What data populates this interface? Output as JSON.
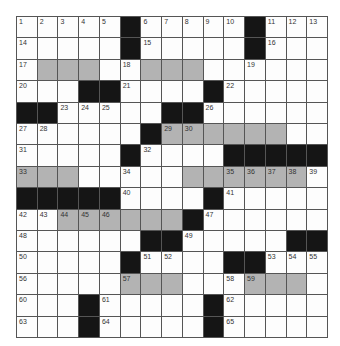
{
  "puzzle": {
    "rows": 15,
    "cols": 15,
    "colors": {
      "black": "#151515",
      "shaded": "#b3b3b3",
      "white": "#fdfdfd",
      "line": "#555555"
    },
    "layout": [
      "WWWWWBWWWWWBWWW",
      "WWWWWBWWWWWBWWW",
      "WSSSWWSSSWWWWWW",
      "WWWBBWWWWBWWWWW",
      "BBWWWWWBBWWWWWW",
      "WWWWWWBSSSSSSWW",
      "WWWWWBWWWWBBBBB",
      "SSSWWWWWSSSSSSW",
      "BBBBBWWWWBWWWWW",
      "WWSSSSSSBWWWWWW",
      "WWWWWWBBWWWWWBB",
      "WWWWWBWWWWBBWWW",
      "WWWWWSSSWWWSSSW",
      "WWWBWWWWWBWWWWW",
      "WWWBWWWWWBWWWWW"
    ],
    "numbers": [
      {
        "r": 0,
        "c": 0,
        "n": "1"
      },
      {
        "r": 0,
        "c": 1,
        "n": "2"
      },
      {
        "r": 0,
        "c": 2,
        "n": "3"
      },
      {
        "r": 0,
        "c": 3,
        "n": "4"
      },
      {
        "r": 0,
        "c": 4,
        "n": "5"
      },
      {
        "r": 0,
        "c": 6,
        "n": "6"
      },
      {
        "r": 0,
        "c": 7,
        "n": "7"
      },
      {
        "r": 0,
        "c": 8,
        "n": "8"
      },
      {
        "r": 0,
        "c": 9,
        "n": "9"
      },
      {
        "r": 0,
        "c": 10,
        "n": "10"
      },
      {
        "r": 0,
        "c": 12,
        "n": "11"
      },
      {
        "r": 0,
        "c": 13,
        "n": "12"
      },
      {
        "r": 0,
        "c": 14,
        "n": "13"
      },
      {
        "r": 1,
        "c": 0,
        "n": "14"
      },
      {
        "r": 1,
        "c": 6,
        "n": "15"
      },
      {
        "r": 1,
        "c": 12,
        "n": "16"
      },
      {
        "r": 2,
        "c": 0,
        "n": "17"
      },
      {
        "r": 2,
        "c": 5,
        "n": "18"
      },
      {
        "r": 2,
        "c": 11,
        "n": "19"
      },
      {
        "r": 3,
        "c": 0,
        "n": "20"
      },
      {
        "r": 3,
        "c": 5,
        "n": "21"
      },
      {
        "r": 3,
        "c": 10,
        "n": "22"
      },
      {
        "r": 4,
        "c": 2,
        "n": "23"
      },
      {
        "r": 4,
        "c": 3,
        "n": "24"
      },
      {
        "r": 4,
        "c": 4,
        "n": "25"
      },
      {
        "r": 4,
        "c": 9,
        "n": "26"
      },
      {
        "r": 5,
        "c": 0,
        "n": "27"
      },
      {
        "r": 5,
        "c": 1,
        "n": "28"
      },
      {
        "r": 5,
        "c": 7,
        "n": "29"
      },
      {
        "r": 5,
        "c": 8,
        "n": "30"
      },
      {
        "r": 6,
        "c": 0,
        "n": "31"
      },
      {
        "r": 6,
        "c": 6,
        "n": "32"
      },
      {
        "r": 7,
        "c": 0,
        "n": "33"
      },
      {
        "r": 7,
        "c": 5,
        "n": "34"
      },
      {
        "r": 7,
        "c": 10,
        "n": "35"
      },
      {
        "r": 7,
        "c": 11,
        "n": "36"
      },
      {
        "r": 7,
        "c": 12,
        "n": "37"
      },
      {
        "r": 7,
        "c": 13,
        "n": "38"
      },
      {
        "r": 7,
        "c": 14,
        "n": "39"
      },
      {
        "r": 8,
        "c": 5,
        "n": "40"
      },
      {
        "r": 8,
        "c": 10,
        "n": "41"
      },
      {
        "r": 9,
        "c": 0,
        "n": "42"
      },
      {
        "r": 9,
        "c": 1,
        "n": "43"
      },
      {
        "r": 9,
        "c": 2,
        "n": "44"
      },
      {
        "r": 9,
        "c": 3,
        "n": "45"
      },
      {
        "r": 9,
        "c": 4,
        "n": "46"
      },
      {
        "r": 9,
        "c": 9,
        "n": "47"
      },
      {
        "r": 10,
        "c": 0,
        "n": "48"
      },
      {
        "r": 10,
        "c": 8,
        "n": "49"
      },
      {
        "r": 11,
        "c": 0,
        "n": "50"
      },
      {
        "r": 11,
        "c": 6,
        "n": "51"
      },
      {
        "r": 11,
        "c": 7,
        "n": "52"
      },
      {
        "r": 11,
        "c": 12,
        "n": "53"
      },
      {
        "r": 11,
        "c": 13,
        "n": "54"
      },
      {
        "r": 11,
        "c": 14,
        "n": "55"
      },
      {
        "r": 12,
        "c": 0,
        "n": "56"
      },
      {
        "r": 12,
        "c": 5,
        "n": "57"
      },
      {
        "r": 12,
        "c": 10,
        "n": "58"
      },
      {
        "r": 12,
        "c": 11,
        "n": "59"
      },
      {
        "r": 13,
        "c": 0,
        "n": "60"
      },
      {
        "r": 13,
        "c": 4,
        "n": "61"
      },
      {
        "r": 13,
        "c": 10,
        "n": "62"
      },
      {
        "r": 14,
        "c": 0,
        "n": "63"
      },
      {
        "r": 14,
        "c": 4,
        "n": "64"
      },
      {
        "r": 14,
        "c": 10,
        "n": "65"
      }
    ]
  }
}
